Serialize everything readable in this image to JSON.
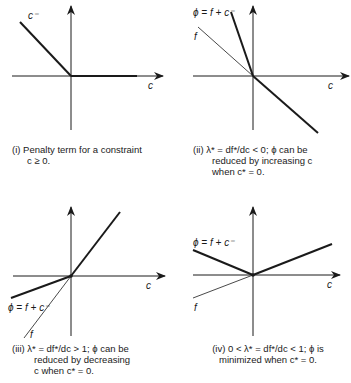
{
  "panels": [
    {
      "id": "i",
      "caption_num": "(i)",
      "caption_line1": "Penalty term for a constraint",
      "caption_line2": "c ≥ 0.",
      "caption_line3": "",
      "labels": {
        "axis": "c",
        "curve1": "c⁻"
      }
    },
    {
      "id": "ii",
      "caption_num": "(ii)",
      "caption_line1": "λ* = df*/dc < 0; ϕ can be",
      "caption_line2": "reduced by increasing c",
      "caption_line3": "when c* = 0.",
      "labels": {
        "axis": "c",
        "phi": "ϕ = f + c⁻",
        "f": "f"
      }
    },
    {
      "id": "iii",
      "caption_num": "(iii)",
      "caption_line1": "λ* = df*/dc > 1; ϕ can be",
      "caption_line2": "reduced by decreasing",
      "caption_line3": "c when c* = 0.",
      "labels": {
        "axis": "c",
        "phi": "ϕ = f + c⁻",
        "f": "f"
      }
    },
    {
      "id": "iv",
      "caption_num": "(iv)",
      "caption_line1": "0 < λ* = df*/dc < 1; ϕ is",
      "caption_line2": "minimized when c* = 0.",
      "caption_line3": "",
      "labels": {
        "axis": "c",
        "phi": "ϕ = f + c⁻",
        "f": "f"
      }
    }
  ],
  "colors": {
    "ink": "#1a1a1a",
    "background": "#ffffff"
  }
}
